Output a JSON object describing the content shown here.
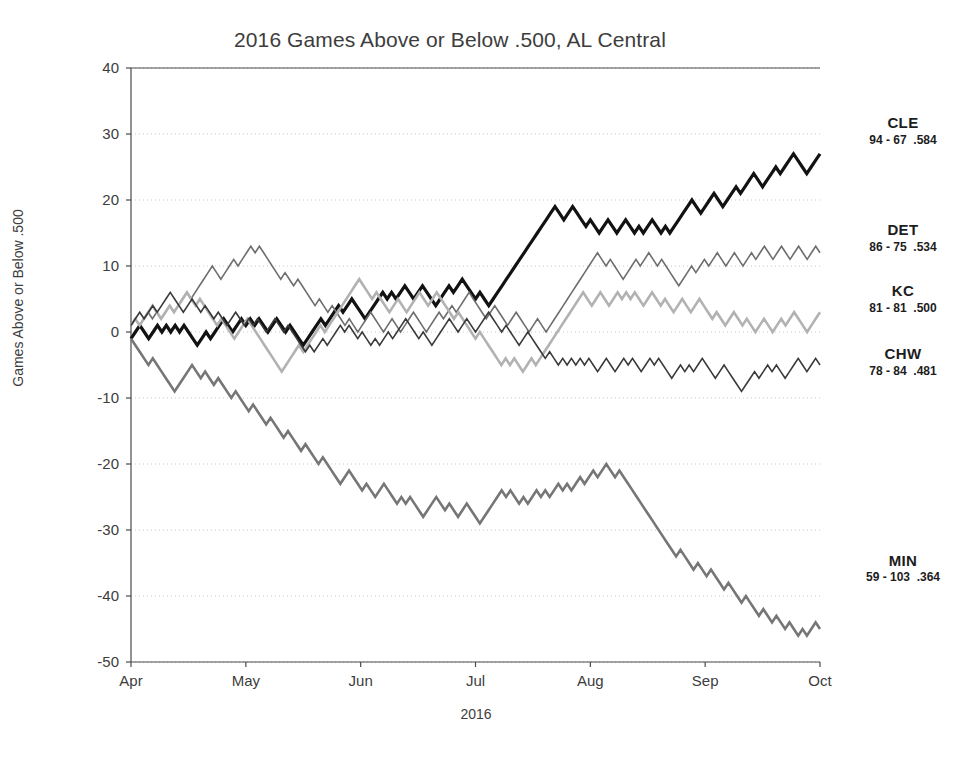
{
  "chart_data": {
    "type": "line",
    "title": "2016 Games Above or Below .500, AL Central",
    "xlabel": "2016",
    "ylabel": "Games Above or Below .500",
    "ylim": [
      -50,
      40
    ],
    "yticks": [
      40,
      30,
      20,
      10,
      0,
      -10,
      -20,
      -30,
      -40,
      -50
    ],
    "xticks": [
      "Apr",
      "May",
      "Jun",
      "Jul",
      "Aug",
      "Sep",
      "Oct"
    ],
    "grid": "horizontal-dotted",
    "legend_position": "right-of-axes-at-series-end",
    "x_unit": "game number (1-162)",
    "series": [
      {
        "name": "CLE",
        "label": "CLE",
        "record": "94 - 67  .584",
        "wins": 94,
        "losses": 67,
        "pct": ".584",
        "color": "#121212",
        "width": 3.2,
        "final": 27,
        "values": [
          -1,
          0,
          1,
          0,
          -1,
          0,
          1,
          0,
          1,
          0,
          1,
          0,
          1,
          0,
          -1,
          -2,
          -1,
          0,
          -1,
          0,
          1,
          2,
          1,
          0,
          1,
          2,
          1,
          2,
          1,
          2,
          1,
          0,
          1,
          2,
          1,
          0,
          1,
          0,
          -1,
          -2,
          -1,
          0,
          1,
          2,
          1,
          2,
          3,
          4,
          3,
          4,
          5,
          4,
          3,
          2,
          3,
          4,
          5,
          6,
          5,
          6,
          5,
          6,
          7,
          6,
          5,
          6,
          7,
          6,
          5,
          4,
          5,
          6,
          7,
          6,
          7,
          8,
          7,
          6,
          5,
          6,
          5,
          4,
          5,
          6,
          7,
          8,
          9,
          10,
          11,
          12,
          13,
          14,
          15,
          16,
          17,
          18,
          19,
          18,
          17,
          18,
          19,
          18,
          17,
          16,
          17,
          16,
          15,
          16,
          17,
          16,
          15,
          16,
          17,
          16,
          15,
          16,
          15,
          16,
          17,
          16,
          15,
          16,
          15,
          16,
          17,
          18,
          19,
          20,
          19,
          18,
          19,
          20,
          21,
          20,
          19,
          20,
          21,
          22,
          21,
          22,
          23,
          24,
          23,
          22,
          23,
          24,
          25,
          24,
          25,
          26,
          27,
          26,
          25,
          24,
          25,
          26,
          27
        ]
      },
      {
        "name": "DET",
        "label": "DET",
        "record": "86 - 75  .534",
        "wins": 86,
        "losses": 75,
        "pct": ".534",
        "color": "#6e6e6e",
        "width": 1.6,
        "final": 12,
        "values": [
          1,
          2,
          1,
          2,
          3,
          2,
          3,
          2,
          3,
          4,
          3,
          4,
          5,
          6,
          5,
          6,
          7,
          8,
          9,
          10,
          9,
          8,
          9,
          10,
          11,
          10,
          11,
          12,
          13,
          12,
          13,
          12,
          11,
          10,
          9,
          8,
          9,
          8,
          7,
          8,
          7,
          6,
          5,
          4,
          5,
          4,
          3,
          4,
          3,
          2,
          1,
          2,
          1,
          0,
          1,
          2,
          3,
          2,
          1,
          0,
          1,
          2,
          1,
          0,
          1,
          2,
          3,
          2,
          1,
          0,
          1,
          2,
          3,
          2,
          3,
          4,
          3,
          4,
          5,
          6,
          5,
          4,
          3,
          2,
          3,
          4,
          3,
          2,
          1,
          2,
          3,
          2,
          1,
          0,
          1,
          2,
          1,
          0,
          1,
          2,
          3,
          4,
          5,
          6,
          7,
          8,
          9,
          10,
          11,
          12,
          11,
          10,
          11,
          10,
          9,
          8,
          9,
          10,
          11,
          10,
          11,
          12,
          11,
          10,
          11,
          10,
          9,
          8,
          7,
          8,
          9,
          10,
          9,
          10,
          11,
          10,
          11,
          12,
          11,
          10,
          11,
          12,
          11,
          10,
          11,
          12,
          11,
          12,
          13,
          12,
          11,
          12,
          13,
          12,
          11,
          12,
          13,
          12,
          11,
          12,
          13,
          12
        ]
      },
      {
        "name": "KC",
        "label": "KC",
        "record": "81 - 81  .500",
        "wins": 81,
        "losses": 81,
        "pct": ".500",
        "color": "#b2b2b2",
        "width": 2.6,
        "final": 3,
        "values": [
          1,
          2,
          1,
          2,
          3,
          4,
          3,
          2,
          3,
          4,
          3,
          4,
          5,
          6,
          5,
          4,
          5,
          4,
          3,
          2,
          1,
          2,
          1,
          0,
          -1,
          0,
          1,
          2,
          1,
          0,
          -1,
          -2,
          -3,
          -4,
          -5,
          -6,
          -5,
          -4,
          -3,
          -2,
          -3,
          -2,
          -1,
          0,
          1,
          0,
          1,
          2,
          3,
          4,
          5,
          6,
          7,
          8,
          7,
          6,
          5,
          6,
          5,
          4,
          3,
          4,
          5,
          4,
          3,
          4,
          5,
          6,
          5,
          4,
          5,
          6,
          5,
          4,
          3,
          2,
          3,
          2,
          1,
          0,
          -1,
          0,
          -1,
          -2,
          -3,
          -4,
          -5,
          -4,
          -5,
          -4,
          -5,
          -6,
          -5,
          -4,
          -5,
          -4,
          -3,
          -2,
          -1,
          0,
          1,
          2,
          3,
          4,
          5,
          6,
          5,
          4,
          5,
          6,
          5,
          4,
          5,
          6,
          5,
          6,
          5,
          6,
          5,
          4,
          5,
          6,
          5,
          4,
          5,
          4,
          3,
          4,
          5,
          4,
          3,
          4,
          5,
          4,
          3,
          2,
          3,
          2,
          1,
          2,
          3,
          2,
          1,
          2,
          1,
          0,
          1,
          2,
          1,
          0,
          1,
          2,
          1,
          2,
          3,
          2,
          1,
          0,
          1,
          2,
          3
        ]
      },
      {
        "name": "CHW",
        "label": "CHW",
        "record": "78 - 84  .481",
        "wins": 78,
        "losses": 84,
        "pct": ".481",
        "color": "#3a3a3a",
        "width": 1.6,
        "final": -5,
        "values": [
          1,
          2,
          3,
          2,
          3,
          4,
          3,
          4,
          5,
          6,
          5,
          4,
          3,
          4,
          5,
          4,
          3,
          4,
          3,
          2,
          3,
          2,
          1,
          2,
          3,
          2,
          1,
          2,
          1,
          2,
          1,
          0,
          1,
          2,
          1,
          0,
          1,
          0,
          -1,
          -2,
          -3,
          -2,
          -3,
          -2,
          -1,
          -2,
          -1,
          0,
          1,
          0,
          1,
          0,
          -1,
          0,
          -1,
          -2,
          -1,
          -2,
          -1,
          0,
          -1,
          0,
          1,
          2,
          1,
          0,
          -1,
          0,
          -1,
          -2,
          -1,
          0,
          1,
          2,
          1,
          0,
          1,
          2,
          1,
          0,
          1,
          2,
          3,
          2,
          1,
          0,
          1,
          0,
          -1,
          -2,
          -1,
          0,
          -1,
          -2,
          -3,
          -4,
          -3,
          -4,
          -5,
          -4,
          -5,
          -4,
          -5,
          -4,
          -5,
          -4,
          -5,
          -6,
          -5,
          -4,
          -5,
          -6,
          -5,
          -4,
          -5,
          -4,
          -5,
          -6,
          -5,
          -4,
          -5,
          -4,
          -5,
          -6,
          -7,
          -6,
          -5,
          -6,
          -5,
          -6,
          -5,
          -4,
          -5,
          -6,
          -7,
          -6,
          -5,
          -6,
          -7,
          -8,
          -9,
          -8,
          -7,
          -6,
          -7,
          -6,
          -5,
          -6,
          -5,
          -6,
          -7,
          -6,
          -5,
          -4,
          -5,
          -6,
          -5,
          -4,
          -5
        ]
      },
      {
        "name": "MIN",
        "label": "MIN",
        "record": "59 - 103  .364",
        "wins": 59,
        "losses": 103,
        "pct": ".364",
        "color": "#767676",
        "width": 2.6,
        "final": -45,
        "values": [
          -1,
          -2,
          -3,
          -4,
          -5,
          -4,
          -5,
          -6,
          -7,
          -8,
          -9,
          -8,
          -7,
          -6,
          -5,
          -6,
          -7,
          -6,
          -7,
          -8,
          -7,
          -8,
          -9,
          -10,
          -9,
          -10,
          -11,
          -12,
          -11,
          -12,
          -13,
          -14,
          -13,
          -14,
          -15,
          -16,
          -15,
          -16,
          -17,
          -18,
          -17,
          -18,
          -19,
          -20,
          -19,
          -20,
          -21,
          -22,
          -23,
          -22,
          -21,
          -22,
          -23,
          -24,
          -23,
          -24,
          -25,
          -24,
          -23,
          -24,
          -25,
          -26,
          -25,
          -26,
          -25,
          -26,
          -27,
          -28,
          -27,
          -26,
          -25,
          -26,
          -27,
          -26,
          -27,
          -28,
          -27,
          -26,
          -27,
          -28,
          -29,
          -28,
          -27,
          -26,
          -25,
          -24,
          -25,
          -24,
          -25,
          -26,
          -25,
          -26,
          -25,
          -24,
          -25,
          -24,
          -25,
          -24,
          -23,
          -24,
          -23,
          -24,
          -23,
          -22,
          -23,
          -22,
          -21,
          -22,
          -21,
          -20,
          -21,
          -22,
          -21,
          -22,
          -23,
          -24,
          -25,
          -26,
          -27,
          -28,
          -29,
          -30,
          -31,
          -32,
          -33,
          -34,
          -33,
          -34,
          -35,
          -36,
          -35,
          -36,
          -37,
          -36,
          -37,
          -38,
          -39,
          -38,
          -39,
          -40,
          -41,
          -40,
          -41,
          -42,
          -43,
          -42,
          -43,
          -44,
          -43,
          -44,
          -45,
          -44,
          -45,
          -46,
          -45,
          -46,
          -45,
          -44,
          -45
        ]
      }
    ]
  },
  "axes": {
    "y_tick_labels": [
      "40",
      "30",
      "20",
      "10",
      "0",
      "-10",
      "-20",
      "-30",
      "-40",
      "-50"
    ],
    "x_tick_labels": [
      "Apr",
      "May",
      "Jun",
      "Jul",
      "Aug",
      "Sep",
      "Oct"
    ]
  }
}
